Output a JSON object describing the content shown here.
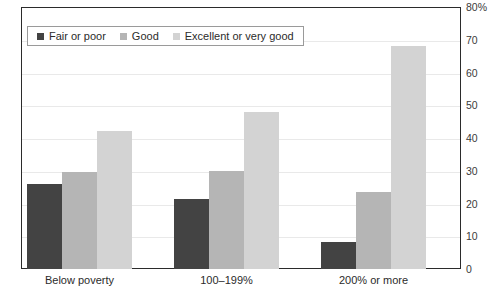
{
  "chart_data": {
    "type": "bar",
    "title": "",
    "xlabel": "",
    "ylabel": "",
    "categories": [
      "Below poverty",
      "100–199%",
      "200% or more"
    ],
    "series": [
      {
        "name": "Fair or poor",
        "color": "#434343",
        "values": [
          26,
          21.5,
          8.3
        ]
      },
      {
        "name": "Good",
        "color": "#b5b5b5",
        "values": [
          29.5,
          30,
          23.5
        ]
      },
      {
        "name": "Excellent or very good",
        "color": "#d3d3d3",
        "values": [
          42,
          48,
          68
        ]
      }
    ],
    "ylim": [
      0,
      80
    ],
    "ytick_values": [
      0,
      10,
      20,
      30,
      40,
      50,
      60,
      70,
      80
    ],
    "ytick_labels": [
      "0",
      "10",
      "20",
      "30",
      "40",
      "50",
      "60",
      "70",
      "80%"
    ],
    "grid": true,
    "legend_position": "top-left",
    "axis_color": "#2b2b2b",
    "grid_color": "#e9e9e9"
  },
  "title_clipped": "",
  "legend": {
    "entries": [
      {
        "label": "Fair or poor"
      },
      {
        "label": "Good"
      },
      {
        "label": "Excellent or very good"
      }
    ]
  }
}
